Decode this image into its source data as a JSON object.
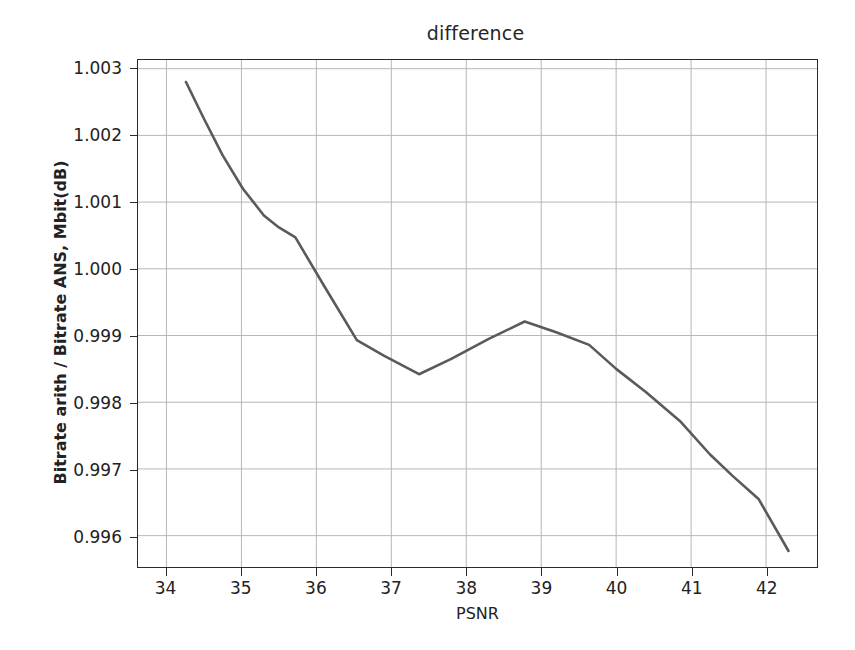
{
  "chart_data": {
    "type": "line",
    "title": "difference",
    "xlabel": "PSNR",
    "ylabel": "Bitrate arith / Bitrate ANS, Mbit(dB)",
    "xlim": [
      33.62,
      42.68
    ],
    "ylim": [
      0.99553,
      1.00313
    ],
    "xticks": [
      34,
      35,
      36,
      37,
      38,
      39,
      40,
      41,
      42
    ],
    "xtick_labels": [
      "34",
      "35",
      "36",
      "37",
      "38",
      "39",
      "40",
      "41",
      "42"
    ],
    "yticks": [
      0.996,
      0.997,
      0.998,
      0.999,
      1.0,
      1.001,
      1.002,
      1.003
    ],
    "ytick_labels": [
      "0.996",
      "0.997",
      "0.998",
      "0.999",
      "1.000",
      "1.001",
      "1.002",
      "1.003"
    ],
    "grid": true,
    "legend": null,
    "line_color": "#5a5a5a",
    "line_width": 2.6,
    "series": [
      {
        "name": "difference",
        "x": [
          34.26,
          34.5,
          34.75,
          35.02,
          35.3,
          35.5,
          35.72,
          36.1,
          36.54,
          36.9,
          37.37,
          37.8,
          38.3,
          38.78,
          39.2,
          39.64,
          40.0,
          40.4,
          40.85,
          41.25,
          41.55,
          41.9,
          42.3
        ],
        "y": [
          1.0028,
          1.00225,
          1.0017,
          1.0012,
          1.0008,
          1.00062,
          1.00047,
          0.99975,
          0.99893,
          0.9987,
          0.99842,
          0.99865,
          0.99895,
          0.99921,
          0.99905,
          0.99886,
          0.9985,
          0.99815,
          0.99772,
          0.99722,
          0.9969,
          0.99655,
          0.99577
        ]
      }
    ]
  },
  "axes": {
    "title": "difference",
    "x_axis_label": "PSNR",
    "y_axis_label": "Bitrate arith / Bitrate ANS, Mbit(dB)"
  }
}
